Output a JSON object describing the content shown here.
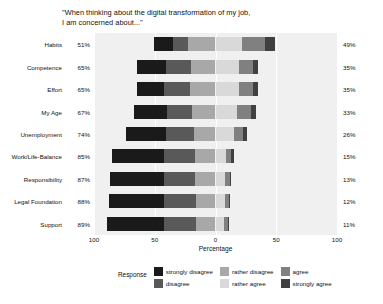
{
  "chart_data": {
    "type": "bar",
    "subtype": "diverging-stacked-likert",
    "title": "\"When thinking about the digital transformation of my job,\nI am concerned about...\"",
    "xlabel": "Percentage",
    "ylabel": "",
    "legend_title": "Response",
    "legend_position": "bottom",
    "grid": true,
    "xlim": [
      -100,
      100
    ],
    "xticks": [
      -100,
      -50,
      0,
      50,
      100
    ],
    "xtick_labels": [
      "100",
      "50",
      "0",
      "50",
      "100"
    ],
    "categories": [
      "Habits",
      "Competence",
      "Effort",
      "My Age",
      "Unemployment",
      "Work/Life-Balance",
      "Responsibility",
      "Legal Foundation",
      "Support"
    ],
    "negative_totals": [
      "51%",
      "65%",
      "65%",
      "67%",
      "74%",
      "85%",
      "87%",
      "88%",
      "89%"
    ],
    "positive_totals": [
      "49%",
      "35%",
      "35%",
      "33%",
      "26%",
      "15%",
      "13%",
      "12%",
      "11%"
    ],
    "series": [
      {
        "name": "strongly disagree",
        "color": "#1a1a1a",
        "side": "negative",
        "values": [
          16,
          24,
          23,
          27,
          33,
          43,
          45,
          46,
          47
        ]
      },
      {
        "name": "disagree",
        "color": "#595959",
        "side": "negative",
        "values": [
          12,
          21,
          21,
          21,
          23,
          25,
          25,
          26,
          26
        ]
      },
      {
        "name": "rather disagree",
        "color": "#a8a8a8",
        "side": "negative",
        "values": [
          23,
          20,
          21,
          19,
          18,
          17,
          17,
          16,
          16
        ]
      },
      {
        "name": "rather agree",
        "color": "#d9d9d9",
        "side": "positive",
        "values": [
          22,
          19,
          19,
          18,
          15,
          9,
          8,
          8,
          7
        ]
      },
      {
        "name": "agree",
        "color": "#808080",
        "side": "positive",
        "values": [
          19,
          12,
          12,
          11,
          8,
          4,
          4,
          3,
          3
        ]
      },
      {
        "name": "strongly agree",
        "color": "#404040",
        "side": "positive",
        "values": [
          8,
          4,
          4,
          4,
          3,
          2,
          1,
          1,
          1
        ]
      }
    ]
  },
  "legend": {
    "title": "Response",
    "columns": [
      [
        {
          "label": "strongly disagree",
          "color": "#1a1a1a"
        },
        {
          "label": "disagree",
          "color": "#595959"
        }
      ],
      [
        {
          "label": "rather disagree",
          "color": "#a8a8a8"
        },
        {
          "label": "rather agree",
          "color": "#d9d9d9"
        }
      ],
      [
        {
          "label": "agree",
          "color": "#808080"
        },
        {
          "label": "strongly agree",
          "color": "#404040"
        }
      ]
    ]
  },
  "colors": {
    "panel_background": "#f0f0f0",
    "page_background": "#ffffff",
    "gridline": "#ffffff",
    "text": "#111111"
  }
}
